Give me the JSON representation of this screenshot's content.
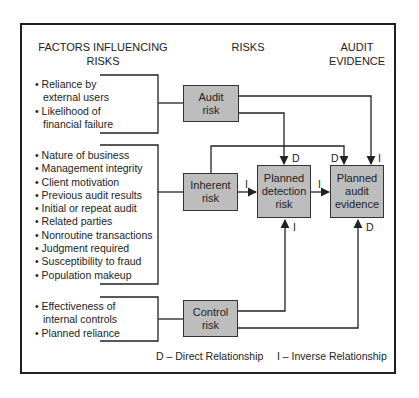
{
  "headers": {
    "factors": "FACTORS INFLUENCING RISKS",
    "risks": "RISKS",
    "evidence": "AUDIT EVIDENCE"
  },
  "factor_groups": [
    {
      "items": [
        {
          "text": "Reliance by",
          "cont": "external users"
        },
        {
          "text": "Likelihood of",
          "cont": "financial failure"
        }
      ]
    },
    {
      "items": [
        {
          "text": "Nature of business"
        },
        {
          "text": "Management integrity"
        },
        {
          "text": "Client motivation"
        },
        {
          "text": "Previous audit results"
        },
        {
          "text": "Initial or repeat audit"
        },
        {
          "text": "Related parties"
        },
        {
          "text": "Nonroutine transactions"
        },
        {
          "text": "Judgment required"
        },
        {
          "text": "Susceptibility to fraud"
        },
        {
          "text": "Population makeup"
        }
      ]
    },
    {
      "items": [
        {
          "text": "Effectiveness of",
          "cont": "internal controls"
        },
        {
          "text": "Planned reliance"
        }
      ]
    }
  ],
  "boxes": {
    "audit_risk": "Audit risk",
    "inherent_risk": "Inherent risk",
    "control_risk": "Control risk",
    "planned_detection_risk": "Planned detection risk",
    "planned_audit_evidence": "Planned audit evidence"
  },
  "relation_labels": {
    "audit_to_detection": "D",
    "inherent_to_evidence": "D",
    "audit_to_evidence": "I",
    "inherent_to_detection": "I",
    "detection_to_evidence": "I",
    "control_to_detection": "I",
    "control_to_evidence": "D"
  },
  "legend": {
    "direct": "D – Direct Relationship",
    "inverse": "I – Inverse Relationship"
  },
  "colors": {
    "box_fill": "#bdbdbd",
    "line": "#222222"
  }
}
